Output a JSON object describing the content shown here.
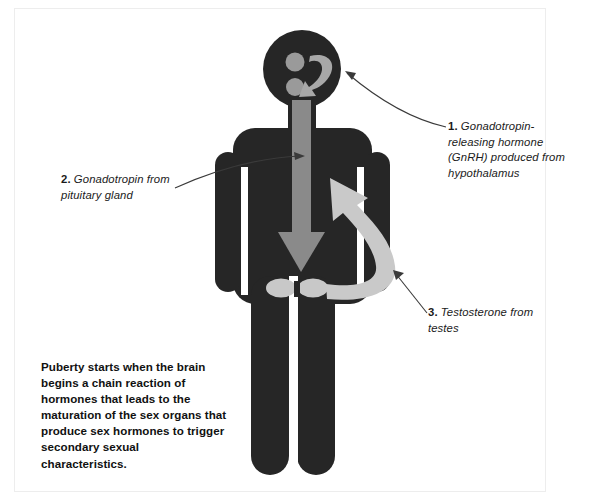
{
  "document": {
    "title": "Puberty hormone cascade diagram"
  },
  "figure": {
    "name": "male-stick-figure",
    "colors": {
      "body": "#262626",
      "arrow_gray": "#8a8a8a",
      "arrow_light_gray": "#c9c9c9",
      "gonad_gray": "#c8c8c8",
      "brain_dot_gray": "#9a9a9a",
      "pointer_line": "#3a3a3a",
      "background": "#ffffff",
      "border": "#ededed"
    },
    "parts": {
      "head": "head-circle",
      "brain_dot_upper": "hypothalamus-dot",
      "brain_dot_lower": "pituitary-dot",
      "brain_arrow": "gnrh-curved-arrow",
      "torso": "torso",
      "left_arm": "left-arm",
      "right_arm": "right-arm",
      "left_leg": "left-leg",
      "right_leg": "right-leg",
      "gonadotropin_arrow": "gonadotropin-down-arrow",
      "testis_left": "left-testis",
      "testis_right": "right-testis",
      "testosterone_arrow": "testosterone-curved-arrow"
    }
  },
  "callouts": [
    {
      "id": "callout-1",
      "number": "1.",
      "text": " Gonadotropin-releasing hormone (GnRH) produced from hypothalamus",
      "pointer": "pointer-line-1"
    },
    {
      "id": "callout-2",
      "number": "2.",
      "text": " Gonadotropin from pituitary gland",
      "pointer": "pointer-line-2"
    },
    {
      "id": "callout-3",
      "number": "3.",
      "text": " Testosterone from testes",
      "pointer": "pointer-line-3"
    }
  ],
  "summary": {
    "text": "Puberty starts when the brain begins a chain reaction of hormones that leads to the maturation of the sex organs that produce sex hormones to trigger secondary sexual characteristics."
  }
}
